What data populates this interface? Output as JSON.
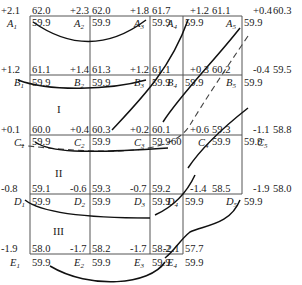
{
  "diagram": {
    "title": "",
    "rows": [
      {
        "row": "A",
        "points": [
          {
            "label": "A1",
            "sub": "1",
            "offset": "+2.1",
            "design": "62.0",
            "ground": "59.9"
          },
          {
            "label": "A2",
            "sub": "2",
            "offset": "+2.3",
            "design": "62.0",
            "ground": "59.9"
          },
          {
            "label": "A3",
            "sub": "3",
            "offset": "+1.8",
            "design": "61.7",
            "ground": "59.9"
          },
          {
            "label": "A4",
            "sub": "4",
            "offset": "+1.2",
            "design": "61.1",
            "ground": "59.9"
          },
          {
            "label": "A5",
            "sub": "5",
            "offset": "+0.4",
            "design": "60.3",
            "ground": "59.9"
          }
        ]
      },
      {
        "row": "B",
        "points": [
          {
            "label": "B1",
            "sub": "1",
            "offset": "+1.2",
            "design": "61.1",
            "ground": "59.9"
          },
          {
            "label": "B2",
            "sub": "2",
            "offset": "+1.4",
            "design": "61.3",
            "ground": "59.9"
          },
          {
            "label": "B3",
            "sub": "3",
            "offset": "+1.2",
            "design": "61.1",
            "ground": "59.9"
          },
          {
            "label": "B4",
            "sub": "4",
            "offset": "+0.3",
            "design": "60.2",
            "ground": "59.9"
          },
          {
            "label": "B5",
            "sub": "5",
            "offset": "-0.4",
            "design": "59.5",
            "ground": "59.9"
          }
        ]
      },
      {
        "row": "C",
        "points": [
          {
            "label": "C1",
            "sub": "1",
            "offset": "+0.1",
            "design": "60.0",
            "ground": "59.9"
          },
          {
            "label": "C2",
            "sub": "2",
            "offset": "+0.4",
            "design": "60.3",
            "ground": "59.9"
          },
          {
            "label": "C3",
            "sub": "3",
            "offset": "+0.2",
            "design": "60.1",
            "ground": "59.9"
          },
          {
            "label": "C4",
            "sub": "4",
            "offset": "+0.6",
            "design": "59.3",
            "ground": "59.9"
          },
          {
            "label": "C5",
            "sub": "5",
            "offset": "-1.1",
            "design": "58.8",
            "ground": "59.9"
          }
        ]
      },
      {
        "row": "D",
        "points": [
          {
            "label": "D1",
            "sub": "1",
            "offset": "-0.8",
            "design": "59.1",
            "ground": "59.9"
          },
          {
            "label": "D2",
            "sub": "2",
            "offset": "-0.6",
            "design": "59.3",
            "ground": "59.9"
          },
          {
            "label": "D3",
            "sub": "3",
            "offset": "-0.7",
            "design": "59.2",
            "ground": "59.9"
          },
          {
            "label": "D4",
            "sub": "4",
            "offset": "-1.4",
            "design": "58.5",
            "ground": "59.9"
          },
          {
            "label": "D5",
            "sub": "5",
            "offset": "-1.9",
            "design": "58.0",
            "ground": "59.9"
          }
        ]
      },
      {
        "row": "E",
        "points": [
          {
            "label": "E1",
            "sub": "1",
            "offset": "-1.9",
            "design": "58.0",
            "ground": "59.9"
          },
          {
            "label": "E2",
            "sub": "2",
            "offset": "-1.7",
            "design": "58.2",
            "ground": "59.9"
          },
          {
            "label": "E3",
            "sub": "3",
            "offset": "-1.7",
            "design": "58.2",
            "ground": "59.9"
          },
          {
            "label": "E4",
            "sub": "4",
            "offset": "-2.1",
            "design": "57.7",
            "ground": "59.9"
          }
        ]
      }
    ],
    "zones": [
      {
        "id": "I",
        "label": "I"
      },
      {
        "id": "II",
        "label": "II"
      },
      {
        "id": "III",
        "label": "III"
      }
    ],
    "annotations": {
      "zero_line_label": "60"
    }
  }
}
